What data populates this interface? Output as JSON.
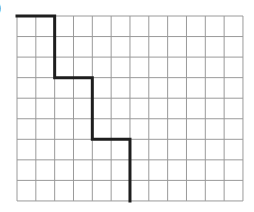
{
  "label": ")",
  "grid": {
    "origin_x": 17,
    "origin_y": 16,
    "cols": 12,
    "rows": 9,
    "cell_w": 18.83,
    "cell_h": 20.55,
    "line_color": "#9a9a9a"
  },
  "path": {
    "color": "#1e1e1e",
    "width": 3,
    "points": [
      [
        0,
        0
      ],
      [
        2,
        0
      ],
      [
        2,
        3
      ],
      [
        4,
        3
      ],
      [
        4,
        6
      ],
      [
        6,
        6
      ],
      [
        6,
        9
      ]
    ]
  }
}
